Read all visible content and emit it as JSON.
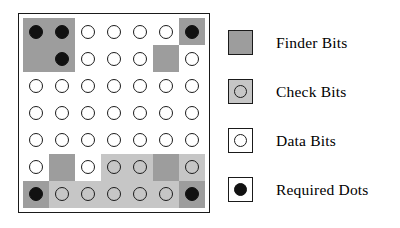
{
  "figure": {
    "kind": "symbology-bit-map-diagram",
    "colors": {
      "finder_gray": "#9d9d9d",
      "check_gray": "#c6c6c6",
      "data_white": "#ffffff",
      "dot_black": "#111111",
      "outline": "#1a1a1a"
    }
  },
  "matrix": {
    "rows": 7,
    "columns": 7,
    "cell_types_legend": {
      "finder": "Finder Bits",
      "check": "Check Bits",
      "data": "Data Bits",
      "required": "Required Dots"
    },
    "cells": [
      [
        {
          "bg": "finder",
          "dot": "filled"
        },
        {
          "bg": "finder",
          "dot": "filled"
        },
        {
          "bg": "data",
          "dot": "open"
        },
        {
          "bg": "data",
          "dot": "open"
        },
        {
          "bg": "data",
          "dot": "open"
        },
        {
          "bg": "data",
          "dot": "open"
        },
        {
          "bg": "finder",
          "dot": "filled"
        }
      ],
      [
        {
          "bg": "finder",
          "dot": "none"
        },
        {
          "bg": "finder",
          "dot": "filled"
        },
        {
          "bg": "data",
          "dot": "open"
        },
        {
          "bg": "data",
          "dot": "open"
        },
        {
          "bg": "data",
          "dot": "open"
        },
        {
          "bg": "finder",
          "dot": "none"
        },
        {
          "bg": "data",
          "dot": "open"
        }
      ],
      [
        {
          "bg": "data",
          "dot": "open"
        },
        {
          "bg": "data",
          "dot": "open"
        },
        {
          "bg": "data",
          "dot": "open"
        },
        {
          "bg": "data",
          "dot": "open"
        },
        {
          "bg": "data",
          "dot": "open"
        },
        {
          "bg": "data",
          "dot": "open"
        },
        {
          "bg": "data",
          "dot": "open"
        }
      ],
      [
        {
          "bg": "data",
          "dot": "open"
        },
        {
          "bg": "data",
          "dot": "open"
        },
        {
          "bg": "data",
          "dot": "open"
        },
        {
          "bg": "data",
          "dot": "open"
        },
        {
          "bg": "data",
          "dot": "open"
        },
        {
          "bg": "data",
          "dot": "open"
        },
        {
          "bg": "data",
          "dot": "open"
        }
      ],
      [
        {
          "bg": "data",
          "dot": "open"
        },
        {
          "bg": "data",
          "dot": "open"
        },
        {
          "bg": "data",
          "dot": "open"
        },
        {
          "bg": "data",
          "dot": "open"
        },
        {
          "bg": "data",
          "dot": "open"
        },
        {
          "bg": "data",
          "dot": "open"
        },
        {
          "bg": "data",
          "dot": "open"
        }
      ],
      [
        {
          "bg": "data",
          "dot": "open"
        },
        {
          "bg": "finder",
          "dot": "none"
        },
        {
          "bg": "data",
          "dot": "open"
        },
        {
          "bg": "check",
          "dot": "open"
        },
        {
          "bg": "check",
          "dot": "open"
        },
        {
          "bg": "finder",
          "dot": "none"
        },
        {
          "bg": "check",
          "dot": "open"
        }
      ],
      [
        {
          "bg": "finder",
          "dot": "filled"
        },
        {
          "bg": "check",
          "dot": "open"
        },
        {
          "bg": "check",
          "dot": "open"
        },
        {
          "bg": "check",
          "dot": "open"
        },
        {
          "bg": "check",
          "dot": "open"
        },
        {
          "bg": "check",
          "dot": "open"
        },
        {
          "bg": "finder",
          "dot": "filled"
        }
      ]
    ]
  },
  "legend": {
    "items": [
      {
        "key": "finder",
        "label": "Finder Bits",
        "swatch": "finder",
        "dot": "none"
      },
      {
        "key": "check",
        "label": "Check Bits",
        "swatch": "check",
        "dot": "open"
      },
      {
        "key": "data",
        "label": "Data Bits",
        "swatch": "data",
        "dot": "open"
      },
      {
        "key": "required",
        "label": "Required Dots",
        "swatch": "req",
        "dot": "filled"
      }
    ]
  }
}
